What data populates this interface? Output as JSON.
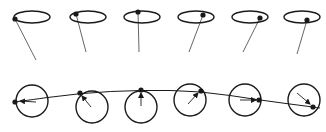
{
  "diagram": {
    "stroke_color": "#1a1a1a",
    "line_color": "#555555",
    "background": "#ffffff",
    "top_row": {
      "description": "precession of a spinning vector around a horizontal ellipse",
      "items": [
        {
          "cx": 32,
          "cy": 17,
          "rx": 18,
          "ry": 6,
          "dot": [
            15,
            19
          ],
          "tail": [
            36,
            60
          ]
        },
        {
          "cx": 88,
          "cy": 17,
          "rx": 18,
          "ry": 6,
          "dot": [
            76,
            14
          ],
          "tail": [
            86,
            52
          ]
        },
        {
          "cx": 142,
          "cy": 17,
          "rx": 18,
          "ry": 6,
          "dot": [
            138,
            12
          ],
          "tail": [
            139,
            52
          ]
        },
        {
          "cx": 196,
          "cy": 17,
          "rx": 18,
          "ry": 6,
          "dot": [
            203,
            15
          ],
          "tail": [
            189,
            52
          ]
        },
        {
          "cx": 250,
          "cy": 17,
          "rx": 18,
          "ry": 6,
          "dot": [
            260,
            18
          ],
          "tail": [
            243,
            52
          ]
        },
        {
          "cx": 302,
          "cy": 17,
          "rx": 18,
          "ry": 6,
          "dot": [
            307,
            20
          ],
          "tail": [
            297,
            54
          ]
        }
      ]
    },
    "bottom_row": {
      "description": "rotating circles with radial arrows; a curve traces the dots",
      "items": [
        {
          "cx": 32,
          "cy": 101,
          "r": 16,
          "dot": [
            15,
            102
          ],
          "arrow_from": [
            36,
            102
          ],
          "arrow_to": [
            20,
            101
          ]
        },
        {
          "cx": 92,
          "cy": 107,
          "r": 16,
          "dot": [
            80,
            93
          ],
          "arrow_from": [
            91,
            107
          ],
          "arrow_to": [
            82,
            96
          ]
        },
        {
          "cx": 141,
          "cy": 107,
          "r": 16,
          "dot": [
            141,
            90
          ],
          "arrow_from": [
            141,
            106
          ],
          "arrow_to": [
            141,
            93
          ]
        },
        {
          "cx": 190,
          "cy": 100,
          "r": 16,
          "dot": [
            201,
            91
          ],
          "arrow_from": [
            188,
            104
          ],
          "arrow_to": [
            198,
            93
          ]
        },
        {
          "cx": 245,
          "cy": 100,
          "r": 16,
          "dot": [
            259,
            100
          ],
          "arrow_from": [
            240,
            100
          ],
          "arrow_to": [
            256,
            100
          ]
        },
        {
          "cx": 304,
          "cy": 100,
          "r": 16,
          "dot": [
            313,
            107
          ],
          "arrow_from": [
            297,
            93
          ],
          "arrow_to": [
            310,
            104
          ]
        }
      ],
      "curve": [
        [
          15,
          102
        ],
        [
          80,
          93
        ],
        [
          141,
          90
        ],
        [
          201,
          91
        ],
        [
          259,
          100
        ],
        [
          313,
          107
        ],
        [
          320,
          108
        ]
      ]
    }
  }
}
